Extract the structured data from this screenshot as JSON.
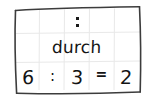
{
  "card": {
    "type": "handwritten-flashcard",
    "language": "German",
    "background_color": "#ffffff",
    "ink_color": "#141414",
    "grid_line_color": "#e8e8e8",
    "border_color": "#3c3c3c",
    "grid": {
      "columns": 5,
      "rows": 3
    },
    "rows": {
      "symbol": {
        "label": "colon-symbol",
        "glyph": ":",
        "dot_count": 2
      },
      "word": {
        "text": "durch"
      },
      "equation": {
        "text": "6 : 3 = 2",
        "cells": [
          {
            "name": "dividend",
            "value": "6",
            "kind": "number"
          },
          {
            "name": "division-operator",
            "value": ":",
            "kind": "operator"
          },
          {
            "name": "divisor",
            "value": "3",
            "kind": "number"
          },
          {
            "name": "equals-operator",
            "value": "=",
            "kind": "operator"
          },
          {
            "name": "quotient",
            "value": "2",
            "kind": "number"
          }
        ]
      }
    }
  }
}
